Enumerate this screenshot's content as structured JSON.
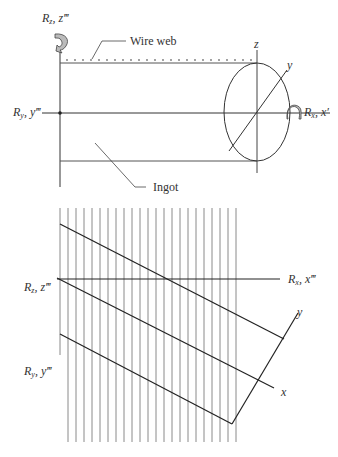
{
  "top_diagram": {
    "labels": {
      "rz_axis": {
        "R": "R",
        "sub": "z",
        "sep": ", ",
        "var": "z‴"
      },
      "ry_axis": {
        "R": "R",
        "sub": "y",
        "sep": ", ",
        "var": "y‴"
      },
      "rx_axis": {
        "R": "R",
        "sub": "x",
        "sep": ", ",
        "var": "x′"
      },
      "wire_web": "Wire web",
      "ingot": "Ingot",
      "z": "z",
      "y": "y"
    },
    "icons": [
      "rotation-arrow-z",
      "rotation-arrow-x"
    ]
  },
  "bottom_diagram": {
    "labels": {
      "rz_axis": {
        "R": "R",
        "sub": "z",
        "sep": ", ",
        "var": "z‴"
      },
      "ry_axis": {
        "R": "R",
        "sub": "y",
        "sep": ", ",
        "var": "y‴"
      },
      "rx_axis": {
        "R": "R",
        "sub": "x",
        "sep": ", ",
        "var": "x‴"
      },
      "x": "x",
      "y": "y"
    },
    "wire_count": 23
  },
  "colors": {
    "line": "#2a2a2a",
    "wire": "#8a8a8a",
    "arrow_fill": "#b0b0b0"
  }
}
